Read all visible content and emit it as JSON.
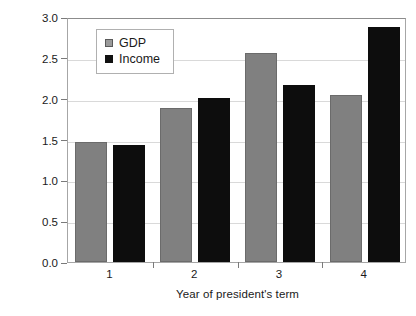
{
  "chart_data": {
    "type": "bar",
    "title": "",
    "subtitle": "",
    "xlabel": "Year of president's term",
    "ylabel": "Average real growth (%)",
    "categories": [
      "1",
      "2",
      "3",
      "4"
    ],
    "series": [
      {
        "name": "GDP",
        "color": "#808080",
        "values": [
          1.47,
          1.88,
          2.56,
          2.04
        ]
      },
      {
        "name": "Income",
        "color": "#0d0d0d",
        "values": [
          1.43,
          2.01,
          2.17,
          2.88
        ]
      }
    ],
    "ylim": [
      0.0,
      3.0
    ],
    "yticks": [
      "0.0",
      "0.5",
      "1.0",
      "1.5",
      "2.0",
      "2.5",
      "3.0"
    ],
    "ytick_values": [
      0.0,
      0.5,
      1.0,
      1.5,
      2.0,
      2.5,
      3.0
    ],
    "xtick_labels": [
      "1",
      "2",
      "3",
      "4"
    ],
    "grid": true,
    "grid_axis": "y",
    "legend_position": "upper-left-inside",
    "legend_entries": [
      "GDP",
      "Income"
    ],
    "bar_group_count": 4,
    "bars_per_group": 2,
    "annotations": []
  },
  "legend": {
    "items": [
      {
        "label": "GDP",
        "swatch": "gray-square-marker"
      },
      {
        "label": "Income",
        "swatch": "black-square-marker"
      }
    ]
  },
  "axes": {
    "y_title": "Average real growth (%)",
    "x_title": "Year of president's term"
  }
}
